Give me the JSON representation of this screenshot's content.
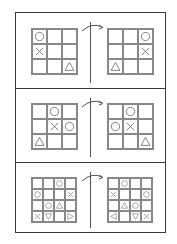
{
  "figure": {
    "transform_arrow": "curved-arrow-right",
    "panels": [
      {
        "size": 3,
        "left": [
          [
            "O",
            "",
            ""
          ],
          [
            "X",
            "",
            ""
          ],
          [
            "",
            "",
            "TRI_UP"
          ]
        ],
        "right": [
          [
            "",
            "",
            "O"
          ],
          [
            "",
            "",
            "X"
          ],
          [
            "TRI_UP",
            "",
            ""
          ]
        ]
      },
      {
        "size": 3,
        "left": [
          [
            "",
            "O",
            ""
          ],
          [
            "",
            "X",
            "O"
          ],
          [
            "TRI_UP",
            "",
            ""
          ]
        ],
        "right": [
          [
            "",
            "O",
            ""
          ],
          [
            "O",
            "X",
            ""
          ],
          [
            "",
            "",
            "TRI_UP"
          ]
        ]
      },
      {
        "size": 4,
        "left": [
          [
            "",
            "",
            "O",
            ""
          ],
          [
            "O",
            "",
            "",
            "X"
          ],
          [
            "",
            "O",
            "TRI_UP",
            ""
          ],
          [
            "X",
            "TRI_DOWN",
            "",
            "TRI_RIGHT"
          ]
        ],
        "right": [
          [
            "",
            "O",
            "",
            ""
          ],
          [
            "X",
            "",
            "",
            "O"
          ],
          [
            "",
            "TRI_UP",
            "O",
            ""
          ],
          [
            "TRI_LEFT",
            "",
            "TRI_DOWN",
            "X"
          ]
        ]
      }
    ]
  },
  "colors": {
    "border": "#3a3a3a",
    "grid": "#888888",
    "symbol": "#777777"
  }
}
